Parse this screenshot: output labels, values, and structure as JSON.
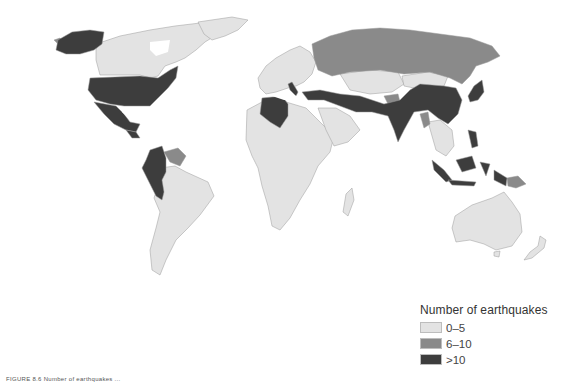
{
  "figure": {
    "type": "choropleth-map",
    "caption_partial": "FIGURE 8.6 Number of earthquakes ..."
  },
  "legend": {
    "title": "Number of earthquakes",
    "classes": [
      {
        "label": "0–5",
        "color": "#e3e3e3"
      },
      {
        "label": "6–10",
        "color": "#8a8a8a"
      },
      {
        "label": ">10",
        "color": "#3d3d3d"
      }
    ]
  },
  "colors": {
    "background": "#ffffff",
    "border": "#9a9a9a",
    "low": "#e3e3e3",
    "mid": "#8a8a8a",
    "high": "#3d3d3d"
  },
  "regions": {
    "high": [
      "United States (incl. Alaska)",
      "Mexico",
      "Guatemala",
      "Colombia",
      "Ecuador",
      "Peru",
      "Italy",
      "Greece",
      "Turkey",
      "Algeria",
      "Iran",
      "Afghanistan",
      "Pakistan",
      "India",
      "China",
      "Japan",
      "Philippines",
      "Indonesia"
    ],
    "mid": [
      "Russia",
      "Venezuela",
      "Costa Rica",
      "Papua New Guinea",
      "Kyrgyzstan/Tajikistan area",
      "Myanmar",
      "Taiwan"
    ],
    "low": [
      "Canada",
      "Greenland",
      "Brazil",
      "Argentina",
      "Bolivia",
      "Chile",
      "Europe (most)",
      "Africa (most)",
      "Arabian Peninsula",
      "Kazakhstan",
      "Mongolia",
      "Southeast Asia mainland",
      "Australia",
      "New Zealand"
    ]
  }
}
